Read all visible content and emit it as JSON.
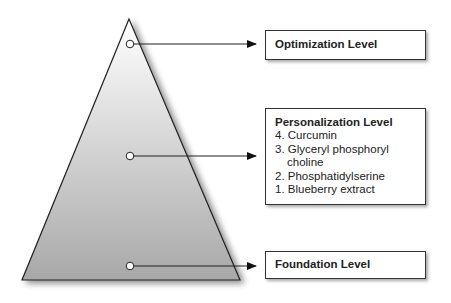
{
  "diagram": {
    "type": "pyramid",
    "colors": {
      "gradient_top": "#ffffff",
      "gradient_bottom": "#a9a9a9",
      "stroke": "#222222"
    },
    "levels": [
      {
        "id": "optimization",
        "title": "Optimization Level",
        "items": []
      },
      {
        "id": "personalization",
        "title": "Personalization Level",
        "items": [
          "4. Curcumin",
          "3. Glyceryl phosphoryl choline",
          "2. Phosphatidylserine",
          "1. Blueberry extract"
        ]
      },
      {
        "id": "foundation",
        "title": "Foundation Level",
        "items": []
      }
    ]
  }
}
